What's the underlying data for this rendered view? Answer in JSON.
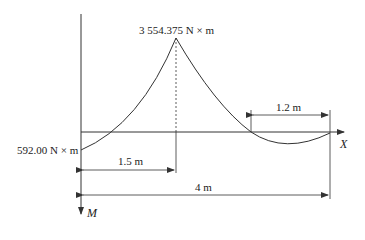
{
  "diagram": {
    "type": "bending-moment-diagram",
    "peak_label": "3 554.375 N × m",
    "start_label": "592.00 N × m",
    "x_axis_label": "X",
    "y_axis_label": "M",
    "dim_left": "1.5 m",
    "dim_total": "4 m",
    "dim_right": "1.2 m"
  },
  "colors": {
    "line": "#333333",
    "background": "#ffffff"
  }
}
